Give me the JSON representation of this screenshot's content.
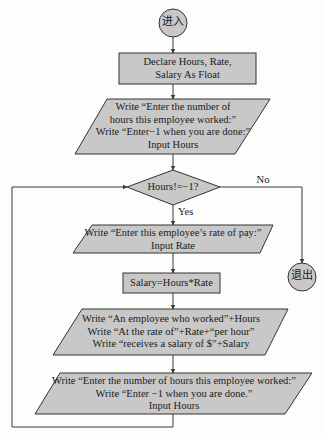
{
  "colors": {
    "fill": "#c8c8c8",
    "stroke": "#333333",
    "line": "#3a3a3a",
    "background": "#fdfdfc"
  },
  "nodes": {
    "start": {
      "type": "terminal",
      "label": "进入"
    },
    "declare": {
      "type": "process",
      "lines": [
        "Declare Hours, Rate,",
        "Salary As Float"
      ]
    },
    "input_hours_1": {
      "type": "io",
      "lines": [
        "Write “Enter the number of",
        "hours this employee worked:”",
        "Write “Enter−1 when you are done:”",
        "Input Hours"
      ]
    },
    "decision": {
      "type": "decision",
      "label": "Hours!=−1?"
    },
    "input_rate": {
      "type": "io",
      "lines": [
        "Write “Enter this employee’s rate of pay:”",
        "Input Rate"
      ]
    },
    "calc_salary": {
      "type": "process",
      "label": "Salary=Hours*Rate"
    },
    "output_salary": {
      "type": "io",
      "lines": [
        "Write “An employee who worked”+Hours",
        "Write “At the rate of”+Rate+“per hour”",
        "Write “receives a salary of $”+Salary"
      ]
    },
    "input_hours_2": {
      "type": "io",
      "lines": [
        "Write “Enter the number of hours this employee worked:”",
        "Write “Enter −1 when you are done.”",
        "Input Hours"
      ]
    },
    "end": {
      "type": "terminal",
      "label": "退出"
    }
  },
  "edges": {
    "yes_label": "Yes",
    "no_label": "No"
  }
}
